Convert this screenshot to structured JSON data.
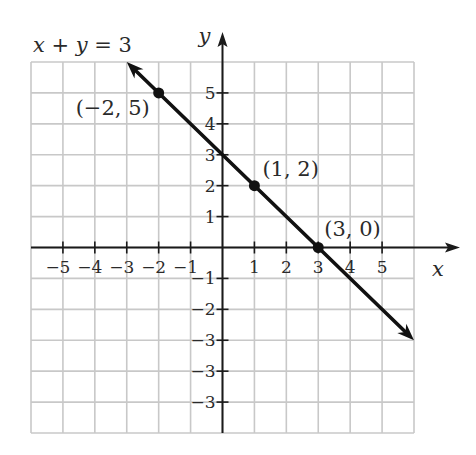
{
  "chart_data": {
    "type": "line",
    "title": "x + y = 3",
    "xlabel": "x",
    "ylabel": "y",
    "xlim": [
      -6,
      6
    ],
    "ylim": [
      -6,
      6
    ],
    "grid": true,
    "x_tick_labels": [
      "−5",
      "−4",
      "−3",
      "−2",
      "−1",
      "1",
      "2",
      "3",
      "4",
      "5"
    ],
    "x_tick_values": [
      -5,
      -4,
      -3,
      -2,
      -1,
      1,
      2,
      3,
      4,
      5
    ],
    "y_tick_labels": [
      "5",
      "4",
      "3",
      "2",
      "1",
      "−1",
      "−2",
      "−3",
      "−3",
      "−3"
    ],
    "y_tick_values": [
      5,
      4,
      3,
      2,
      1,
      -1,
      -2,
      -3,
      -4,
      -5
    ],
    "series": [
      {
        "name": "x + y = 3",
        "line_from": [
          -3,
          6
        ],
        "line_to": [
          6,
          -3
        ],
        "arrows_both_ends": true,
        "points": [
          {
            "x": -2,
            "y": 5,
            "label": "(−2, 5)"
          },
          {
            "x": 1,
            "y": 2,
            "label": "(1, 2)"
          },
          {
            "x": 3,
            "y": 0,
            "label": "(3, 0)"
          }
        ]
      }
    ]
  },
  "colors": {
    "grid": "#c8c8c8",
    "axis": "#1a1a1a",
    "line": "#111111"
  }
}
